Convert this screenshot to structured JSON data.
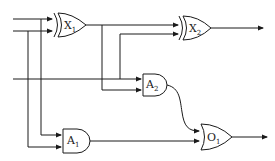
{
  "diagram": {
    "type": "logic-circuit",
    "gates": [
      {
        "id": "X1",
        "kind": "XOR",
        "letter": "X",
        "index": "1"
      },
      {
        "id": "X2",
        "kind": "XOR",
        "letter": "X",
        "index": "2"
      },
      {
        "id": "A1",
        "kind": "AND",
        "letter": "A",
        "index": "1"
      },
      {
        "id": "A2",
        "kind": "AND",
        "letter": "A",
        "index": "2"
      },
      {
        "id": "O1",
        "kind": "OR",
        "letter": "O",
        "index": "1"
      }
    ],
    "inputs": [
      "in1",
      "in2",
      "in3"
    ],
    "outputs": [
      "X2",
      "O1"
    ],
    "connections": [
      [
        "in1",
        "X1"
      ],
      [
        "in2",
        "X1"
      ],
      [
        "in1",
        "A1"
      ],
      [
        "in2",
        "A1"
      ],
      [
        "X1",
        "X2"
      ],
      [
        "in3",
        "X2"
      ],
      [
        "in3",
        "A2"
      ],
      [
        "X1",
        "A2"
      ],
      [
        "A2",
        "O1"
      ],
      [
        "A1",
        "O1"
      ]
    ],
    "colors": {
      "stroke": "#1a1a1a",
      "background": "#ffffff"
    }
  }
}
